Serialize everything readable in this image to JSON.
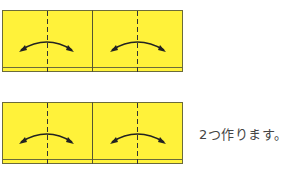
{
  "diagram": {
    "panels": [
      {
        "id": "top",
        "top": 10
      },
      {
        "id": "bottom",
        "top": 102
      }
    ],
    "caption": "2つ作ります。",
    "colors": {
      "paper": "#fff23a",
      "outline": "#5a5a3a",
      "crease": "#333333",
      "arrow": "#222222"
    }
  }
}
